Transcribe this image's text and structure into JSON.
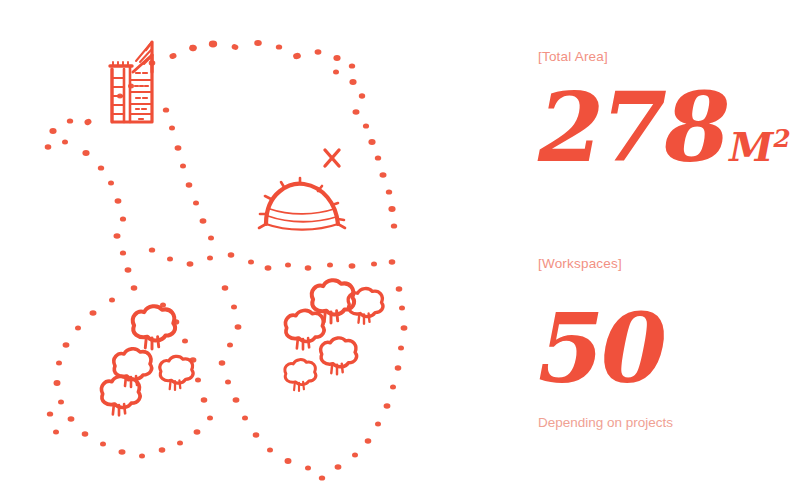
{
  "theme": {
    "background": "#ffffff",
    "ink_strong": "#F0513C",
    "ink_mid": "#F29183",
    "ink_soft": "#F0A193"
  },
  "map": {
    "title": "hand-drawn site plan",
    "markers": {
      "spot_marker": "X"
    },
    "features": [
      {
        "name": "tower-building",
        "kind": "building",
        "label": ""
      },
      {
        "name": "dome-pavilion",
        "kind": "pavilion",
        "label": ""
      },
      {
        "name": "tree-cluster-left",
        "kind": "trees",
        "count": 4
      },
      {
        "name": "tree-cluster-right",
        "kind": "trees",
        "count": 5
      }
    ],
    "plots": [
      {
        "name": "plot-north",
        "kind": "dotted-boundary"
      },
      {
        "name": "plot-west",
        "kind": "dotted-boundary"
      },
      {
        "name": "plot-southwest",
        "kind": "dotted-boundary"
      },
      {
        "name": "plot-southeast",
        "kind": "dotted-boundary"
      }
    ]
  },
  "stats": {
    "area": {
      "label": "[Total Area]",
      "value": "278",
      "unit": "M",
      "unit_exponent": "2"
    },
    "workspaces": {
      "label": "[Workspaces]",
      "value": "50",
      "note": "Depending on projects"
    }
  }
}
